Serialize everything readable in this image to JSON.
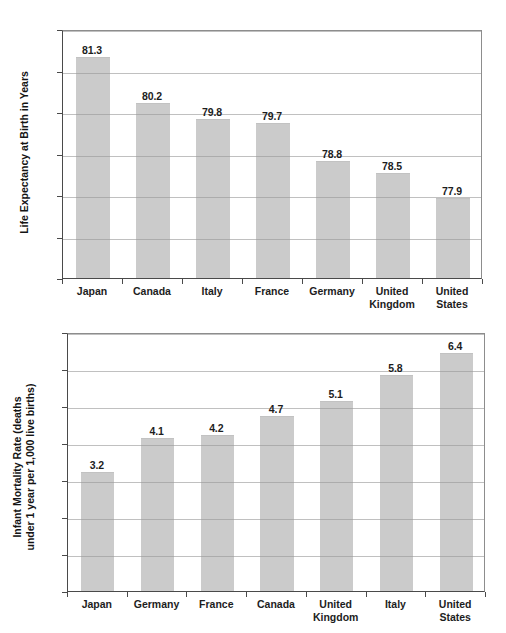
{
  "chart_data": [
    {
      "id": "life-expectancy",
      "type": "bar",
      "title": "",
      "xlabel": "",
      "ylabel": "Life Expectancy at Birth in Years",
      "ylim": [
        76,
        82
      ],
      "yticks": [
        "76",
        "77",
        "78",
        "79",
        "80",
        "81",
        "82"
      ],
      "ytick_values": [
        76,
        77,
        78,
        79,
        80,
        81,
        82
      ],
      "grid": true,
      "legend": "none",
      "categories": [
        "Japan",
        "Canada",
        "Italy",
        "France",
        "Germany",
        "United Kingdom",
        "United States"
      ],
      "values": [
        81.3,
        80.2,
        79.8,
        79.7,
        78.8,
        78.5,
        77.9
      ],
      "value_labels": [
        "81.3",
        "80.2",
        "79.8",
        "79.7",
        "78.8",
        "78.5",
        "77.9"
      ],
      "bar_color": "#cbcbcb"
    },
    {
      "id": "infant-mortality",
      "type": "bar",
      "title": "",
      "xlabel": "",
      "ylabel": "Infant Mortality Rate (deaths\nunder 1 year per 1,000 live births)",
      "ylabel_line1": "Infant Mortality Rate (deaths",
      "ylabel_line2": "under 1 year per 1,000 live births)",
      "ylim": [
        0,
        7
      ],
      "yticks": [
        "0",
        "1",
        "2",
        "3",
        "4",
        "5",
        "6",
        "7"
      ],
      "ytick_values": [
        0,
        1,
        2,
        3,
        4,
        5,
        6,
        7
      ],
      "grid": true,
      "legend": "none",
      "categories": [
        "Japan",
        "Germany",
        "France",
        "Canada",
        "United Kingdom",
        "Italy",
        "United States"
      ],
      "values": [
        3.2,
        4.1,
        4.2,
        4.7,
        5.1,
        5.8,
        6.4
      ],
      "value_labels": [
        "3.2",
        "4.1",
        "4.2",
        "4.7",
        "5.1",
        "5.8",
        "6.4"
      ],
      "bar_color": "#cbcbcb"
    }
  ],
  "figures": [
    {
      "name": "life-expectancy-chart",
      "plot": {
        "left": 62,
        "top": 30,
        "width": 420,
        "height": 249
      },
      "ylabel_box": {
        "cx": 24,
        "cy": 155,
        "width": 210
      },
      "xlabel_top": 285
    },
    {
      "name": "infant-mortality-chart",
      "plot": {
        "left": 67,
        "top": 333,
        "width": 418,
        "height": 259
      },
      "ylabel_box": {
        "cx": 24,
        "cy": 463,
        "width": 230
      },
      "xlabel_top": 598
    }
  ]
}
